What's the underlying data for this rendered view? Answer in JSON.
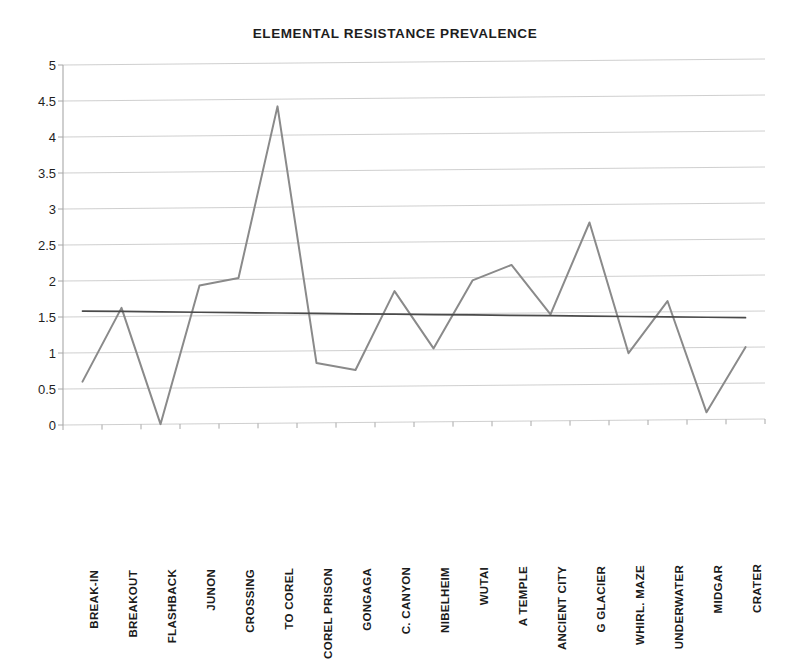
{
  "chart_data": {
    "type": "line",
    "title": "ELEMENTAL RESISTANCE PREVALENCE",
    "xlabel": "",
    "ylabel": "",
    "ylim": [
      0,
      5
    ],
    "yticks": [
      "5",
      "4.5",
      "4",
      "3.5",
      "3",
      "2.5",
      "2",
      "1.5",
      "1",
      "0.5",
      "0"
    ],
    "ytick_values": [
      5,
      4.5,
      4,
      3.5,
      3,
      2.5,
      2,
      1.5,
      1,
      0.5,
      0
    ],
    "grid": true,
    "legend": "none",
    "categories": [
      "BREAK-IN",
      "BREAKOUT",
      "FLASHBACK",
      "JUNON",
      "CROSSING",
      "TO COREL",
      "COREL PRISON",
      "GONGAGA",
      "C. CANYON",
      "NIBELHEIM",
      "WUTAI",
      "A TEMPLE",
      "ANCIENT CITY",
      "G GLACIER",
      "WHIRL. MAZE",
      "UNDERWATER",
      "MIDGAR",
      "CRATER"
    ],
    "series": [
      {
        "name": "prevalence",
        "color": "#8a8a8a",
        "values": [
          0.6,
          1.62,
          0.0,
          1.92,
          2.02,
          4.4,
          0.83,
          0.73,
          1.82,
          1.02,
          1.96,
          2.17,
          1.48,
          2.75,
          0.93,
          1.65,
          0.1,
          1.0
        ]
      },
      {
        "name": "trendline",
        "color": "#4a4a4a",
        "values": [
          1.58,
          1.57,
          1.56,
          1.55,
          1.54,
          1.53,
          1.52,
          1.51,
          1.5,
          1.49,
          1.48,
          1.47,
          1.46,
          1.45,
          1.44,
          1.43,
          1.42,
          1.41
        ]
      }
    ]
  },
  "colors": {
    "data_line": "#8a8a8a",
    "trend_line": "#4a4a4a",
    "gridline": "#c9c9c9",
    "axis": "#a8a8a8",
    "text": "#1b1b1b"
  }
}
